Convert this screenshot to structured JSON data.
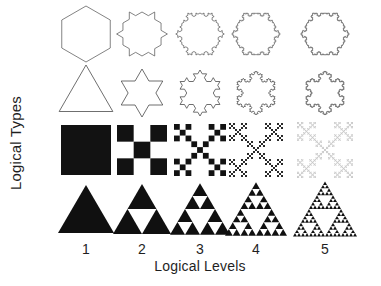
{
  "figure": {
    "title": "",
    "background_color": "#ffffff",
    "ylabel": "Logical Types",
    "xlabel": "Logical Levels",
    "column_labels": [
      "1",
      "2",
      "3",
      "4",
      "5"
    ],
    "column_centers_px": [
      86,
      142,
      200,
      256,
      325
    ],
    "row_centers_px": [
      34,
      93,
      150,
      209
    ],
    "ink_color": "#000000",
    "outline_color": "#5a5a5a",
    "faded_color": "#9a9a9a"
  },
  "chart_data": {
    "type": "diagram",
    "title": "",
    "xlabel": "Logical Levels",
    "ylabel": "Logical Types",
    "categories": [
      "1",
      "2",
      "3",
      "4",
      "5"
    ],
    "rows": [
      {
        "name": "koch-hexagon",
        "label": "Koch snowflake (hexagonal seed)",
        "style": "outline",
        "seed_sides": 6,
        "iterations": [
          0,
          1,
          2,
          3,
          4
        ],
        "stroke": "#5a5a5a",
        "fill": "none"
      },
      {
        "name": "koch-triangle",
        "label": "Koch snowflake (triangular seed)",
        "style": "outline",
        "seed_sides": 3,
        "iterations": [
          0,
          1,
          2,
          3,
          4
        ],
        "stroke": "#4a4a4a",
        "fill": "none"
      },
      {
        "name": "vicsek-saltire",
        "label": "Vicsek fractal (saltire / X form)",
        "style": "filled",
        "iterations": [
          0,
          1,
          2,
          3,
          4
        ],
        "fills": [
          "#121212",
          "#121212",
          "#121212",
          "#2a2a2a",
          "#9a9a9a"
        ]
      },
      {
        "name": "sierpinski-triangle",
        "label": "Sierpinski triangle",
        "style": "filled",
        "iterations": [
          0,
          1,
          2,
          3,
          4
        ],
        "fill": "#101010"
      }
    ]
  }
}
